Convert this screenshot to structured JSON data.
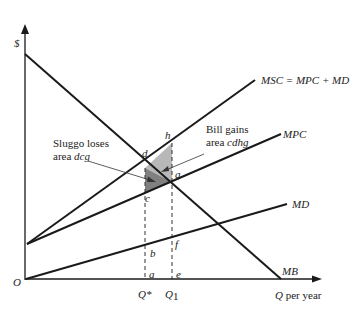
{
  "axes": {
    "y_label": "$",
    "x_label_var": "Q",
    "x_label_suffix": " per year",
    "origin": "O"
  },
  "curves": {
    "msc": "MSC = MPC + MD",
    "mpc": "MPC",
    "md": "MD",
    "mb": "MB"
  },
  "points": {
    "d": "d",
    "h": "h",
    "g": "g",
    "c": "c",
    "b": "b",
    "f": "f",
    "a": "a",
    "e": "e"
  },
  "quantities": {
    "q_star": "Q*",
    "q1_var": "Q",
    "q1_sub": "1"
  },
  "annotations": {
    "sluggo_line1": "Sluggo loses",
    "sluggo_line2_prefix": "area ",
    "sluggo_line2_area": "dcg",
    "bill_line1": "Bill gains",
    "bill_line2_prefix": "area ",
    "bill_line2_area": "cdhg"
  },
  "colors": {
    "sluggo_area": "#808080",
    "bill_area": "#b8b8b8",
    "line": "#1a1a1a"
  }
}
